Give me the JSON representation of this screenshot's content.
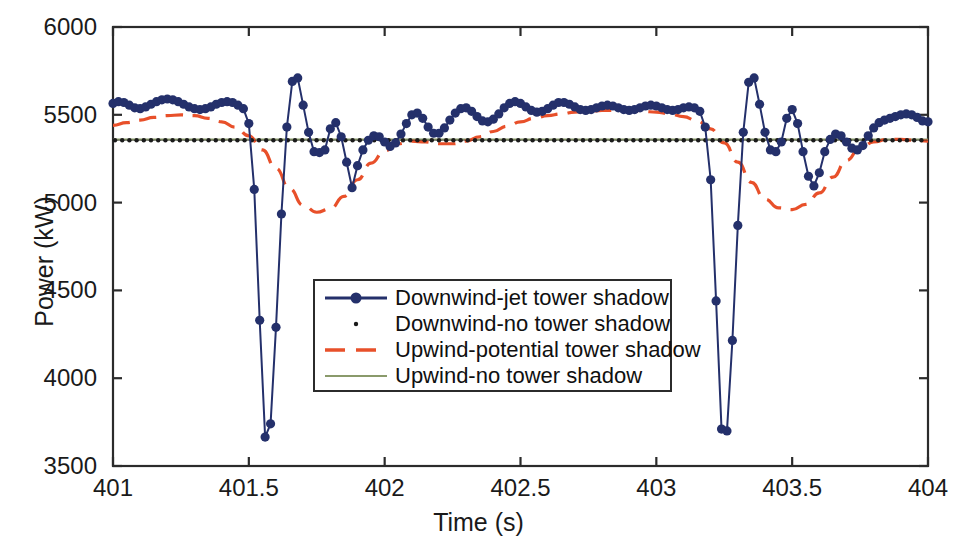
{
  "chart_data": {
    "type": "line",
    "title": "",
    "xlabel": "Time (s)",
    "ylabel": "Power (kW)",
    "xlim": [
      401,
      404
    ],
    "ylim": [
      3500,
      6000
    ],
    "xticks": [
      "401",
      "401.5",
      "402",
      "402.5",
      "403",
      "403.5",
      "404"
    ],
    "xtick_values": [
      401,
      401.5,
      402,
      402.5,
      403,
      403.5,
      404
    ],
    "yticks": [
      "3500",
      "4000",
      "4500",
      "5000",
      "5500",
      "6000"
    ],
    "ytick_values": [
      3500,
      4000,
      4500,
      5000,
      5500,
      6000
    ],
    "grid": false,
    "legend_position": "center",
    "series": [
      {
        "name": "Downwind-jet tower shadow",
        "color": "#24306b",
        "style": "solid-markers",
        "marker": "circle",
        "x": [
          401.0,
          401.02,
          401.04,
          401.06,
          401.08,
          401.1,
          401.12,
          401.14,
          401.16,
          401.18,
          401.2,
          401.22,
          401.24,
          401.26,
          401.28,
          401.3,
          401.32,
          401.34,
          401.36,
          401.38,
          401.4,
          401.42,
          401.44,
          401.46,
          401.48,
          401.5,
          401.52,
          401.54,
          401.56,
          401.58,
          401.6,
          401.62,
          401.64,
          401.66,
          401.68,
          401.7,
          401.72,
          401.74,
          401.76,
          401.78,
          401.8,
          401.82,
          401.84,
          401.86,
          401.88,
          401.9,
          401.92,
          401.94,
          401.96,
          401.98,
          402.0,
          402.02,
          402.04,
          402.06,
          402.08,
          402.1,
          402.12,
          402.14,
          402.16,
          402.18,
          402.2,
          402.22,
          402.24,
          402.26,
          402.28,
          402.3,
          402.32,
          402.34,
          402.36,
          402.38,
          402.4,
          402.42,
          402.44,
          402.46,
          402.48,
          402.5,
          402.52,
          402.54,
          402.56,
          402.58,
          402.6,
          402.62,
          402.64,
          402.66,
          402.68,
          402.7,
          402.72,
          402.74,
          402.76,
          402.78,
          402.8,
          402.82,
          402.84,
          402.86,
          402.88,
          402.9,
          402.92,
          402.94,
          402.96,
          402.98,
          403.0,
          403.02,
          403.04,
          403.06,
          403.08,
          403.1,
          403.12,
          403.14,
          403.16,
          403.18,
          403.2,
          403.22,
          403.24,
          403.26,
          403.28,
          403.3,
          403.32,
          403.34,
          403.36,
          403.38,
          403.4,
          403.42,
          403.44,
          403.46,
          403.48,
          403.5,
          403.52,
          403.54,
          403.56,
          403.58,
          403.6,
          403.62,
          403.64,
          403.66,
          403.68,
          403.7,
          403.72,
          403.74,
          403.76,
          403.78,
          403.8,
          403.82,
          403.84,
          403.86,
          403.88,
          403.9,
          403.92,
          403.94,
          403.96,
          403.98,
          404.0
        ],
        "y": [
          5565,
          5575,
          5570,
          5555,
          5540,
          5535,
          5545,
          5560,
          5575,
          5585,
          5590,
          5585,
          5575,
          5560,
          5545,
          5535,
          5530,
          5535,
          5545,
          5560,
          5570,
          5575,
          5570,
          5555,
          5535,
          5450,
          5075,
          4330,
          3665,
          3740,
          4290,
          4935,
          5430,
          5690,
          5710,
          5555,
          5400,
          5290,
          5285,
          5300,
          5420,
          5455,
          5375,
          5230,
          5085,
          5210,
          5300,
          5355,
          5380,
          5375,
          5345,
          5320,
          5340,
          5390,
          5450,
          5500,
          5510,
          5480,
          5430,
          5395,
          5395,
          5425,
          5470,
          5510,
          5535,
          5540,
          5520,
          5490,
          5465,
          5460,
          5475,
          5505,
          5540,
          5565,
          5575,
          5565,
          5545,
          5525,
          5515,
          5520,
          5535,
          5555,
          5570,
          5570,
          5560,
          5545,
          5530,
          5525,
          5530,
          5540,
          5550,
          5555,
          5550,
          5540,
          5530,
          5525,
          5530,
          5540,
          5550,
          5555,
          5550,
          5540,
          5530,
          5525,
          5530,
          5540,
          5545,
          5540,
          5520,
          5430,
          5130,
          4440,
          3710,
          3700,
          4215,
          4870,
          5400,
          5685,
          5710,
          5560,
          5400,
          5300,
          5290,
          5345,
          5480,
          5530,
          5450,
          5290,
          5150,
          5095,
          5170,
          5290,
          5360,
          5390,
          5380,
          5345,
          5310,
          5300,
          5325,
          5380,
          5425,
          5455,
          5470,
          5480,
          5490,
          5500,
          5505,
          5500,
          5485,
          5465,
          5460
        ]
      },
      {
        "name": "Downwind-no tower shadow",
        "color": "#1a1a1a",
        "style": "dotted-markers",
        "marker": "point",
        "value": 5355
      },
      {
        "name": "Upwind-potential tower shadow",
        "color": "#e8502a",
        "style": "dashed",
        "x": [
          401.0,
          401.05,
          401.1,
          401.15,
          401.2,
          401.25,
          401.3,
          401.35,
          401.4,
          401.45,
          401.5,
          401.55,
          401.6,
          401.65,
          401.7,
          401.75,
          401.8,
          401.85,
          401.9,
          401.95,
          402.0,
          402.05,
          402.1,
          402.15,
          402.2,
          402.25,
          402.3,
          402.35,
          402.4,
          402.45,
          402.5,
          402.55,
          402.6,
          402.65,
          402.7,
          402.75,
          402.8,
          402.85,
          402.9,
          402.95,
          403.0,
          403.05,
          403.1,
          403.15,
          403.2,
          403.25,
          403.3,
          403.35,
          403.4,
          403.45,
          403.5,
          403.55,
          403.6,
          403.65,
          403.7,
          403.75,
          403.8,
          403.85,
          403.9,
          403.95,
          404.0
        ],
        "y": [
          5440,
          5455,
          5470,
          5485,
          5495,
          5500,
          5495,
          5480,
          5460,
          5430,
          5380,
          5300,
          5195,
          5080,
          4985,
          4945,
          4965,
          5035,
          5130,
          5225,
          5295,
          5335,
          5350,
          5345,
          5335,
          5335,
          5350,
          5375,
          5405,
          5435,
          5460,
          5480,
          5495,
          5505,
          5515,
          5520,
          5525,
          5525,
          5525,
          5520,
          5515,
          5505,
          5490,
          5465,
          5420,
          5340,
          5230,
          5115,
          5020,
          4970,
          4960,
          4990,
          5055,
          5145,
          5240,
          5310,
          5345,
          5360,
          5360,
          5355,
          5350
        ]
      },
      {
        "name": "Upwind-no tower shadow",
        "color": "#8a9a6b",
        "style": "solid",
        "value": 5360
      }
    ]
  },
  "legend": {
    "items": [
      {
        "label": "Downwind-jet tower shadow"
      },
      {
        "label": "Downwind-no tower shadow"
      },
      {
        "label": "Upwind-potential tower shadow"
      },
      {
        "label": "Upwind-no tower shadow"
      }
    ]
  },
  "colors": {
    "downwind_jet": "#24306b",
    "downwind_no": "#1a1a1a",
    "upwind_potential": "#e8502a",
    "upwind_no": "#8a9a6b",
    "axis": "#2b2b2b",
    "background": "#ffffff"
  }
}
